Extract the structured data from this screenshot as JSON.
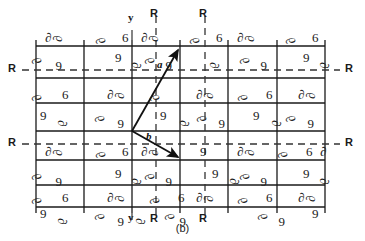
{
  "figure": {
    "caption": "(b)",
    "kind": "crystallographic-space-group-diagram"
  },
  "axis_labels": {
    "y_top": "y",
    "y_bottom": "y",
    "r_top_left": "R",
    "r_top_right": "R",
    "r_bottom_left": "R",
    "r_bottom_right": "R",
    "r_left_upper": "R",
    "r_left_lower": "R",
    "r_right_upper": "R",
    "r_right_lower": "R"
  },
  "vectors": {
    "a": {
      "label": "a",
      "from": [
        132,
        131
      ],
      "to": [
        181,
        46
      ]
    },
    "b": {
      "label": "b",
      "from": [
        132,
        131
      ],
      "to": [
        181,
        160
      ]
    }
  },
  "geometry": {
    "solid_vertical_x": [
      36,
      84,
      132,
      180,
      228,
      277,
      325
    ],
    "solid_horizontal_y": [
      46,
      78,
      103,
      131,
      160,
      185,
      207
    ],
    "dashed_vertical_x": [
      156,
      205
    ],
    "dashed_horizontal_y": [
      70,
      144
    ],
    "motif_rows_y": [
      40,
      58,
      96,
      113,
      153,
      171,
      196,
      212
    ],
    "cell_width": 48,
    "cell_height": 57
  },
  "colors": {
    "ink": "#1a1a1a",
    "background": "#ffffff",
    "dash": "#333333"
  },
  "motifs": {
    "glyph_comma_up": "6",
    "glyph_comma_down": "9",
    "glyph_comma_left": "∂",
    "glyph_comma_right": "α"
  }
}
